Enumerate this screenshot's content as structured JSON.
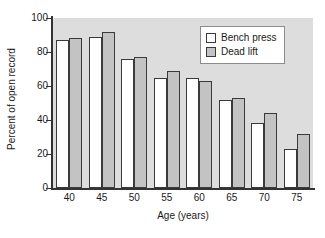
{
  "chart_data": {
    "type": "bar",
    "title": "",
    "xlabel": "Age (years)",
    "ylabel": "Percent of open record",
    "categories": [
      "40",
      "45",
      "50",
      "55",
      "60",
      "65",
      "70",
      "75"
    ],
    "series": [
      {
        "name": "Bench press",
        "color": "#ffffff",
        "values": [
          87,
          89,
          76,
          65,
          65,
          52,
          38,
          23
        ]
      },
      {
        "name": "Dead lift",
        "color": "#c3c3c3",
        "values": [
          88,
          92,
          77,
          69,
          63,
          53,
          44,
          32
        ]
      }
    ],
    "ylim": [
      0,
      100
    ],
    "yticks": [
      0,
      20,
      40,
      60,
      80,
      100
    ],
    "grid": false,
    "legend_position": "top-right",
    "plot_background": "#dddddd",
    "axis_color": "#333333",
    "bar_edge_color": "#3a3a3a"
  }
}
